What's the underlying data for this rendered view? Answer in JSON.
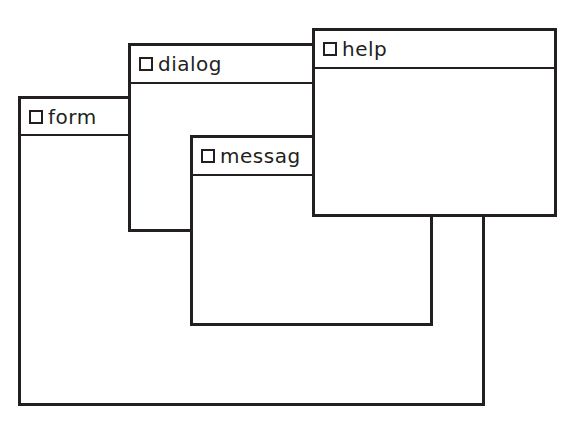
{
  "windows": [
    {
      "id": "form",
      "title": "form"
    },
    {
      "id": "dialog",
      "title": "dialog"
    },
    {
      "id": "message",
      "title": "messag"
    },
    {
      "id": "help",
      "title": "help"
    }
  ],
  "colors": {
    "stroke": "#231f20",
    "background": "#ffffff"
  }
}
